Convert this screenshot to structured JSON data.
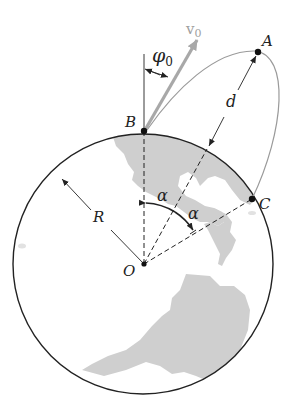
{
  "figure": {
    "colors": {
      "land": "#cfcfcf",
      "outline": "#222222",
      "trajectory": "#9a9a9a",
      "velocity_arrow": "#a8a8a8",
      "label": "#222222"
    }
  },
  "labels": {
    "v0": "v",
    "v0_sub": "0",
    "phi0": "φ",
    "phi0_sub": "0",
    "A": "A",
    "B": "B",
    "C": "C",
    "O": "O",
    "d": "d",
    "R": "R",
    "alpha1": "α",
    "alpha2": "α"
  },
  "points": {
    "O": [
      144,
      264
    ],
    "B": [
      144,
      131
    ],
    "A": [
      258,
      52
    ],
    "C": [
      252,
      199
    ]
  },
  "circle": {
    "cx": 143,
    "cy": 264,
    "r": 130
  }
}
